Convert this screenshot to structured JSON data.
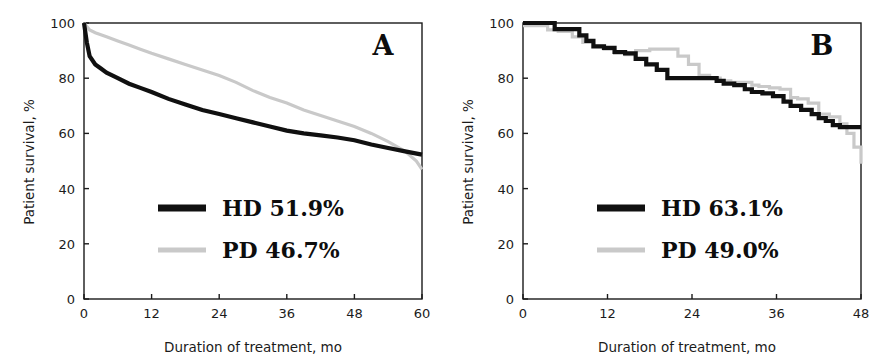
{
  "figure": {
    "background": "#ffffff",
    "panels": [
      {
        "letter": "A",
        "xlabel": "Duration of treatment, mo",
        "ylabel": "Patient survival, %",
        "xticks": [
          "0",
          "12",
          "24",
          "36",
          "48",
          "60"
        ],
        "yticks": [
          "0",
          "20",
          "40",
          "60",
          "80",
          "100"
        ],
        "legend": [
          {
            "label": "HD  51.9%",
            "color": "#101010"
          },
          {
            "label": "PD  46.7%",
            "color": "#c9c9c9"
          }
        ]
      },
      {
        "letter": "B",
        "xlabel": "Duration of treatment, mo",
        "ylabel": "Patient survival, %",
        "xticks": [
          "0",
          "12",
          "24",
          "36",
          "48"
        ],
        "yticks": [
          "0",
          "20",
          "40",
          "60",
          "80",
          "100"
        ],
        "legend": [
          {
            "label": "HD  63.1%",
            "color": "#101010"
          },
          {
            "label": "PD  49.0%",
            "color": "#c9c9c9"
          }
        ]
      }
    ]
  },
  "chart_data": [
    {
      "type": "line",
      "panel": "A",
      "title": "A",
      "xlabel": "Duration of treatment, mo",
      "ylabel": "Patient survival, %",
      "xlim": [
        0,
        60
      ],
      "ylim": [
        0,
        100
      ],
      "xticks": [
        0,
        12,
        24,
        36,
        48,
        60
      ],
      "yticks": [
        0,
        20,
        40,
        60,
        80,
        100
      ],
      "grid": false,
      "legend_position": "center-left",
      "series": [
        {
          "name": "HD",
          "final_value": 51.9,
          "color": "#101010",
          "x": [
            0,
            0.5,
            1,
            2,
            3,
            4,
            5,
            6,
            8,
            10,
            12,
            15,
            18,
            21,
            24,
            27,
            30,
            33,
            36,
            39,
            42,
            45,
            48,
            51,
            54,
            57,
            60
          ],
          "y": [
            100,
            93,
            88,
            85,
            83.5,
            82,
            81,
            80,
            78,
            76.5,
            75,
            72.5,
            70.5,
            68.5,
            67,
            65.5,
            64,
            62.5,
            61,
            60,
            59.3,
            58.5,
            57.5,
            56,
            54.7,
            53.5,
            52.3
          ]
        },
        {
          "name": "PD",
          "final_value": 46.7,
          "color": "#c9c9c9",
          "x": [
            0,
            1,
            2,
            4,
            6,
            8,
            10,
            12,
            15,
            18,
            21,
            24,
            27,
            30,
            33,
            36,
            39,
            42,
            45,
            48,
            51,
            54,
            57,
            59,
            60
          ],
          "y": [
            100,
            97.5,
            96.5,
            95,
            93.5,
            92,
            90.5,
            89,
            87,
            85,
            83,
            81,
            78.5,
            75.5,
            73,
            71,
            68.5,
            66.5,
            64.5,
            62.5,
            60,
            57,
            53.5,
            50,
            47
          ]
        }
      ]
    },
    {
      "type": "line",
      "panel": "B",
      "title": "B",
      "xlabel": "Duration of treatment, mo",
      "ylabel": "Patient survival, %",
      "xlim": [
        0,
        48
      ],
      "ylim": [
        0,
        100
      ],
      "xticks": [
        0,
        12,
        24,
        36,
        48
      ],
      "yticks": [
        0,
        20,
        40,
        60,
        80,
        100
      ],
      "grid": false,
      "legend_position": "center-left",
      "step": true,
      "series": [
        {
          "name": "HD",
          "final_value": 63.1,
          "color": "#101010",
          "x": [
            0,
            3,
            4.5,
            7,
            8,
            9,
            10,
            11.5,
            13,
            14.5,
            16,
            17.5,
            19,
            20.5,
            22,
            26.5,
            27.5,
            28.5,
            30,
            31.5,
            32.5,
            34,
            35.5,
            37,
            38,
            39.5,
            41,
            42,
            43,
            44,
            45,
            48
          ],
          "y": [
            100,
            100,
            97.8,
            97.8,
            95.5,
            93.5,
            91.5,
            91,
            89.5,
            89,
            87,
            85,
            83,
            80,
            80,
            80,
            79,
            78,
            77.5,
            76,
            75,
            74.5,
            73.5,
            71.5,
            70,
            68.5,
            67,
            65.5,
            64.5,
            63,
            62.3,
            62.3
          ]
        },
        {
          "name": "PD",
          "final_value": 49.0,
          "color": "#c9c9c9",
          "x": [
            0,
            2,
            3.5,
            5,
            7,
            8.5,
            10,
            11.5,
            13,
            14.5,
            16,
            18,
            20,
            22,
            23.5,
            25,
            26.5,
            28,
            29.5,
            31,
            32.5,
            33.5,
            35,
            36.5,
            38,
            39,
            40.5,
            42,
            43.5,
            45,
            46,
            47,
            48
          ],
          "y": [
            99,
            99,
            97.5,
            97,
            95,
            93,
            91.5,
            90.5,
            89,
            88.5,
            90,
            90.5,
            90.5,
            88,
            85,
            81,
            80,
            79,
            78.5,
            78.5,
            77.5,
            77,
            76.5,
            76,
            73,
            72.5,
            71,
            67,
            66,
            63.5,
            60,
            55,
            49
          ]
        }
      ]
    }
  ]
}
